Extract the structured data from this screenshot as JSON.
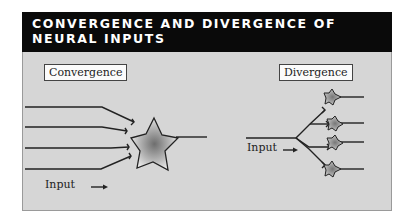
{
  "title": "CONVERGENCE AND DIVERGENCE OF NEURAL INPUTS",
  "convergence": {
    "label": "Convergence",
    "input_label": "Input",
    "input_count": 4,
    "output_count": 1
  },
  "divergence": {
    "label": "Divergence",
    "input_label": "Input",
    "input_count": 1,
    "output_count": 4
  },
  "colors": {
    "header_bg": "#0a0a0a",
    "header_text": "#ffffff",
    "panel_bg": "#d6d6d6",
    "line": "#222222",
    "neuron_fill": "#8a8a8a"
  }
}
